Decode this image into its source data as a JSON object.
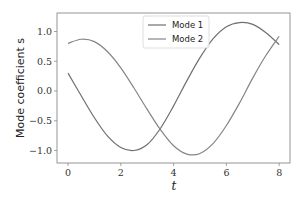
{
  "chart_data": {
    "type": "line",
    "title": "",
    "xlabel": "t",
    "ylabel": "Mode coefficient s",
    "xlim": [
      -0.4,
      8.4
    ],
    "ylim": [
      -1.2,
      1.3
    ],
    "xticks": [
      "0",
      "2",
      "4",
      "6",
      "8"
    ],
    "yticks": [
      "-1.0",
      "-0.5",
      "0.0",
      "0.5",
      "1.0"
    ],
    "grid": false,
    "legend_position": "upper center",
    "series": [
      {
        "name": "Mode 1",
        "color": "#707070",
        "x": [
          0,
          0.5,
          1,
          1.5,
          2,
          2.5,
          3,
          3.5,
          4,
          4.5,
          5,
          5.5,
          6,
          6.5,
          7,
          7.5,
          8
        ],
        "values": [
          0.3,
          -0.08,
          -0.45,
          -0.76,
          -0.95,
          -1.0,
          -0.9,
          -0.63,
          -0.25,
          0.17,
          0.56,
          0.88,
          1.08,
          1.15,
          1.12,
          0.98,
          0.78
        ]
      },
      {
        "name": "Mode 2",
        "color": "#858585",
        "x": [
          0,
          0.5,
          1,
          1.5,
          2,
          2.5,
          3,
          3.5,
          4,
          4.5,
          5,
          5.5,
          6,
          6.5,
          7,
          7.5,
          8
        ],
        "values": [
          0.8,
          0.87,
          0.83,
          0.66,
          0.39,
          0.05,
          -0.31,
          -0.65,
          -0.92,
          -1.06,
          -1.05,
          -0.88,
          -0.58,
          -0.2,
          0.22,
          0.6,
          0.92
        ]
      }
    ]
  },
  "legend": {
    "items": [
      "Mode 1",
      "Mode 2"
    ]
  }
}
